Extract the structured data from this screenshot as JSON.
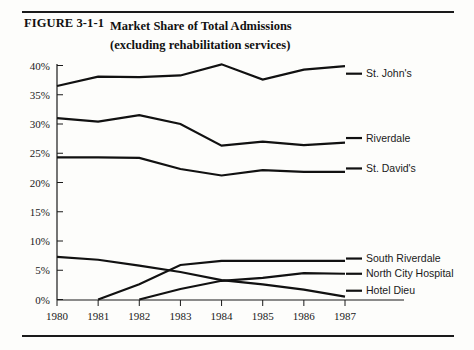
{
  "figure": {
    "label": "FIGURE 3-1-1",
    "title_line1": "Market Share of Total Admissions",
    "title_line2": "(excluding rehabilitation services)"
  },
  "colors": {
    "ink": "#111111",
    "rule": "#1a1a1a",
    "background": "#fdfdfb"
  },
  "chart_data": {
    "type": "line",
    "xlabel": "",
    "ylabel": "",
    "x": [
      1980,
      1981,
      1982,
      1983,
      1984,
      1985,
      1986,
      1987
    ],
    "xtick_labels": [
      "1980",
      "1981",
      "1982",
      "1983",
      "1984",
      "1985",
      "1986",
      "1987"
    ],
    "ytick_labels": [
      "0%",
      "5%",
      "10%",
      "15%",
      "20%",
      "25%",
      "30%",
      "35%",
      "40%"
    ],
    "ytick_values": [
      0,
      5,
      10,
      15,
      20,
      25,
      30,
      35,
      40
    ],
    "ylim": [
      0,
      40
    ],
    "xlim": [
      1980,
      1987
    ],
    "grid": false,
    "legend_position": "right-of-axes",
    "units": "percent",
    "series": [
      {
        "name": "St. John's",
        "x": [
          1980,
          1981,
          1982,
          1983,
          1984,
          1985,
          1986,
          1987
        ],
        "values": [
          36.5,
          38.1,
          38.0,
          38.3,
          40.2,
          37.6,
          39.3,
          39.9
        ],
        "legend_label": "St. John's"
      },
      {
        "name": "Riverdale",
        "x": [
          1980,
          1981,
          1982,
          1983,
          1984,
          1985,
          1986,
          1987
        ],
        "values": [
          31.0,
          30.4,
          31.5,
          30.0,
          26.3,
          27.0,
          26.4,
          26.8
        ],
        "legend_label": "Riverdale"
      },
      {
        "name": "St. David's",
        "x": [
          1980,
          1981,
          1982,
          1983,
          1984,
          1985,
          1986,
          1987
        ],
        "values": [
          24.3,
          24.3,
          24.2,
          22.3,
          21.2,
          22.1,
          21.8,
          21.8
        ],
        "legend_label": "St. David's"
      },
      {
        "name": "South Riverdale",
        "x": [
          1981,
          1982,
          1983,
          1984,
          1985,
          1986,
          1987
        ],
        "values": [
          0.0,
          2.6,
          5.9,
          6.6,
          6.6,
          6.6,
          6.6
        ],
        "legend_label": "South Riverdale"
      },
      {
        "name": "North City Hospital",
        "x": [
          1982,
          1983,
          1984,
          1985,
          1986,
          1987
        ],
        "values": [
          0.0,
          1.8,
          3.2,
          3.7,
          4.5,
          4.4
        ],
        "legend_label": "North City Hospital"
      },
      {
        "name": "Hotel Dieu",
        "x": [
          1980,
          1981,
          1982,
          1983,
          1984,
          1985,
          1986,
          1987
        ],
        "values": [
          7.3,
          6.8,
          5.8,
          4.7,
          3.3,
          2.6,
          1.7,
          0.5
        ],
        "legend_label": "Hotel Dieu"
      }
    ],
    "legend_entries": [
      {
        "label": "St. John's",
        "y_value": 38.6
      },
      {
        "label": "Riverdale",
        "y_value": 27.6
      },
      {
        "label": "St. David's",
        "y_value": 22.4
      },
      {
        "label": "South Riverdale",
        "y_value": 7.0
      },
      {
        "label": "North City Hospital",
        "y_value": 4.4
      },
      {
        "label": "Hotel Dieu",
        "y_value": 1.5
      }
    ]
  }
}
